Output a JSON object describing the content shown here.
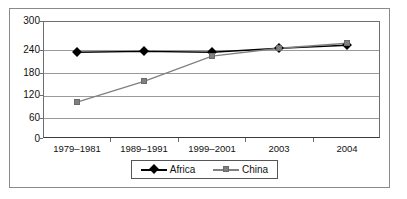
{
  "chart_data": {
    "type": "line",
    "title": "",
    "subtitle": "",
    "xlabel": "",
    "ylabel": "",
    "categories": [
      "1979–1981",
      "1989–1991",
      "1999–2001",
      "2003",
      "2004"
    ],
    "series": [
      {
        "name": "Africa",
        "color": "#000000",
        "marker": "diamond",
        "values": [
          220,
          222,
          220,
          230,
          238
        ]
      },
      {
        "name": "China",
        "color": "#808080",
        "marker": "square",
        "values": [
          92,
          145,
          210,
          230,
          243
        ]
      }
    ],
    "ylim": [
      0,
      300
    ],
    "yticks": [
      0,
      60,
      120,
      180,
      240,
      300
    ],
    "ytick_labels": [
      "0",
      "60",
      "120",
      "180",
      "240",
      "300"
    ],
    "grid": true,
    "grid_axis": "y",
    "legend_position": "bottom",
    "legend_entries": [
      "Africa",
      "China"
    ]
  },
  "axes": {
    "y_tick_labels": [
      "300",
      "240",
      "180",
      "120",
      "60",
      "0"
    ],
    "x_tick_labels": [
      "1979–1981",
      "1989–1991",
      "1999–2001",
      "2003",
      "2004"
    ]
  },
  "legend": {
    "items": [
      {
        "label": "Africa",
        "marker": "diamond-marker-icon",
        "color": "#000000"
      },
      {
        "label": "China",
        "marker": "square-marker-icon",
        "color": "#808080"
      }
    ]
  },
  "colors": {
    "africa": "#000000",
    "china": "#808080",
    "gridline": "#9a9a9a",
    "frame": "#8a8a8a",
    "background": "#ffffff"
  }
}
